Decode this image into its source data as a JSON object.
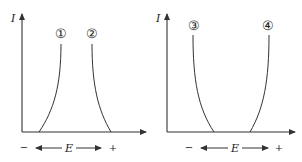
{
  "figure": {
    "panels": [
      {
        "id": "left",
        "y_axis_label": "I",
        "x_axis_label": "E",
        "minus_label": "−",
        "plus_label": "+",
        "curves": [
          {
            "label": "①",
            "direction": "rising toward negative E"
          },
          {
            "label": "②",
            "direction": "rising toward positive E"
          }
        ]
      },
      {
        "id": "right",
        "y_axis_label": "I",
        "x_axis_label": "E",
        "minus_label": "−",
        "plus_label": "+",
        "curves": [
          {
            "label": "③",
            "direction": "rising toward negative E"
          },
          {
            "label": "④",
            "direction": "rising toward positive E"
          }
        ]
      }
    ],
    "colors": {
      "line": "#333333",
      "background": "#ffffff"
    }
  }
}
